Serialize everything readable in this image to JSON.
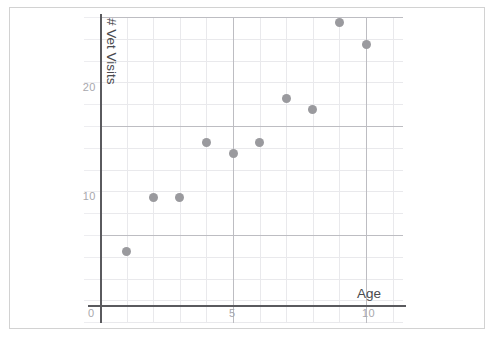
{
  "chart_data": {
    "type": "scatter",
    "title": "",
    "xlabel": "Age",
    "ylabel": "# Vet Visits",
    "xlim": [
      0,
      11.4
    ],
    "ylim": [
      0,
      28
    ],
    "xticks": [
      "5",
      "10"
    ],
    "xtick_values": [
      5,
      10
    ],
    "yticks": [
      "10",
      "20"
    ],
    "ytick_values": [
      10,
      20
    ],
    "origin_label": "0",
    "grid": true,
    "grid_style": "graph-paper",
    "legend": "none",
    "marker_color": "#9a9a9e",
    "axis_color": "#5a5a5e",
    "grid_major_color": "#bdbdc2",
    "grid_minor_color": "#e9e9ec",
    "points": [
      {
        "x": 1,
        "y": 5
      },
      {
        "x": 2,
        "y": 10
      },
      {
        "x": 3,
        "y": 10
      },
      {
        "x": 4,
        "y": 15
      },
      {
        "x": 5,
        "y": 14
      },
      {
        "x": 6,
        "y": 15
      },
      {
        "x": 7,
        "y": 19
      },
      {
        "x": 8,
        "y": 18
      },
      {
        "x": 9,
        "y": 26
      },
      {
        "x": 10,
        "y": 24
      }
    ]
  }
}
